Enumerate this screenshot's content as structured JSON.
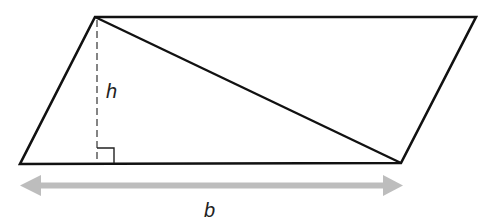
{
  "diagram": {
    "labels": {
      "height": "h",
      "base": "b"
    },
    "vertices": {
      "top_left": [
        95,
        17
      ],
      "top_right": [
        476,
        17
      ],
      "bottom_right": [
        401,
        163
      ],
      "bottom_left": [
        20,
        164
      ]
    },
    "colors": {
      "outline": "#111111",
      "height_line": "#666666",
      "base_arrow": "#bdbdbd",
      "label": "#222222"
    }
  }
}
